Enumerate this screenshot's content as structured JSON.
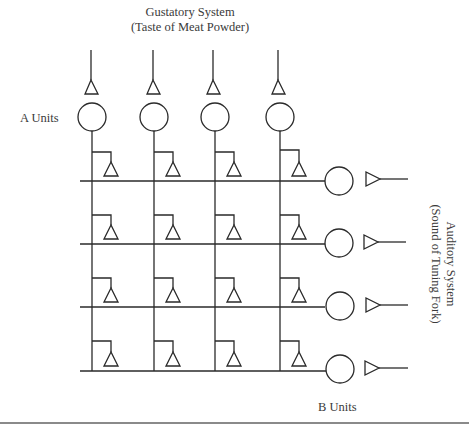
{
  "diagram": {
    "title_line1": "Gustatory System",
    "title_line2": "(Taste of Meat Powder)",
    "a_units_label": "A Units",
    "b_units_label": "B Units",
    "auditory_line1": "Auditory System",
    "auditory_line2": "(Sound of Tuning Fork)",
    "a_unit_count": 4,
    "b_unit_count": 4,
    "line_color": "#2a2a2a",
    "rule_color": "#8a8a8a"
  }
}
